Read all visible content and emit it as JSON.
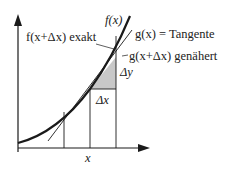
{
  "diagram": {
    "labels": {
      "f_x": "f(x)",
      "f_x_dx_exakt": "f(x+Δx) exakt",
      "g_x_tangente": "g(x) = Tangente",
      "g_x_dx_genaehert": "g(x+Δx) genähert",
      "delta_y": "Δy",
      "delta_x": "Δx",
      "x_axis": "x"
    },
    "colors": {
      "line": "#1a1a1a",
      "shade": "#c8c8c8",
      "background": "#ffffff"
    }
  }
}
